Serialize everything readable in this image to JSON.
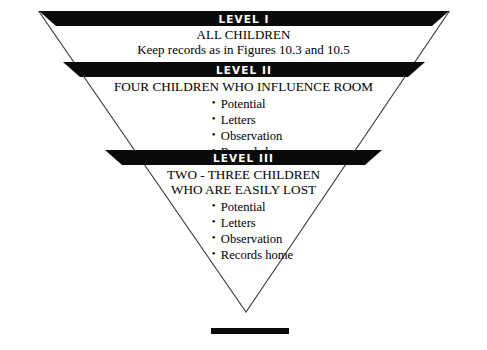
{
  "figure": {
    "type": "inverted-triangle-funnel",
    "shape_name": "inverted-triangle",
    "bottom_rule_name": "bottom-rule",
    "outline_color": "#3b3b3b",
    "banner_color": "#0a0a0a",
    "banner_text_color": "#ffffff",
    "background_color": "#ffffff"
  },
  "levels": [
    {
      "banner": "LEVEL I",
      "heading": "ALL CHILDREN",
      "note": "Keep records as in Figures 10.3 and 10.5",
      "subheading": "",
      "bullets": []
    },
    {
      "banner": "LEVEL II",
      "heading": "FOUR CHILDREN WHO INFLUENCE ROOM",
      "note": "",
      "subheading": "",
      "bullets": [
        "Potential",
        "Letters",
        "Observation",
        "Records home"
      ]
    },
    {
      "banner": "LEVEL III",
      "heading": "TWO - THREE CHILDREN",
      "subheading": "WHO ARE EASILY LOST",
      "note": "",
      "bullets": [
        "Potential",
        "Letters",
        "Observation",
        "Records home"
      ]
    }
  ]
}
